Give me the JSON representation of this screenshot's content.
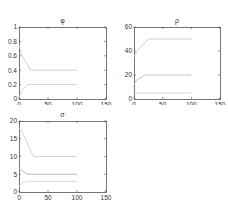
{
  "chart_data": [
    {
      "type": "line",
      "title": "φ",
      "xlabel": "",
      "ylabel": "",
      "xlim": [
        0,
        150
      ],
      "ylim": [
        0,
        1
      ],
      "xticks": [
        0,
        50,
        100,
        150
      ],
      "yticks": [
        0,
        0.2,
        0.4,
        0.6,
        0.8,
        1
      ],
      "ytick_labels": [
        "0",
        "0.2",
        "0.4",
        "0.6",
        "0.8",
        "1"
      ],
      "grid": false,
      "series": [
        {
          "name": "upper",
          "x": [
            0,
            5,
            20,
            100
          ],
          "y": [
            0.75,
            0.6,
            0.4,
            0.4
          ],
          "color": "#c8c8c8"
        },
        {
          "name": "lower",
          "x": [
            0,
            5,
            15,
            100
          ],
          "y": [
            0.02,
            0.12,
            0.2,
            0.2
          ],
          "color": "#d0d0d0"
        }
      ]
    },
    {
      "type": "line",
      "title": "ρ",
      "xlabel": "",
      "ylabel": "",
      "xlim": [
        0,
        150
      ],
      "ylim": [
        0,
        60
      ],
      "xticks": [
        0,
        50,
        100,
        150
      ],
      "yticks": [
        0,
        20,
        40,
        60
      ],
      "ytick_labels": [
        "0",
        "20",
        "40",
        "60"
      ],
      "grid": false,
      "series": [
        {
          "name": "high",
          "x": [
            0,
            5,
            25,
            100
          ],
          "y": [
            35,
            40,
            50,
            50
          ],
          "color": "#c8c8c8"
        },
        {
          "name": "mid",
          "x": [
            0,
            5,
            20,
            100
          ],
          "y": [
            12,
            16,
            20,
            20
          ],
          "color": "#c0c0c0"
        },
        {
          "name": "low",
          "x": [
            0,
            100
          ],
          "y": [
            5,
            5
          ],
          "color": "#d0d0d0"
        }
      ]
    },
    {
      "type": "line",
      "title": "σ",
      "xlabel": "",
      "ylabel": "",
      "xlim": [
        0,
        150
      ],
      "ylim": [
        0,
        20
      ],
      "xticks": [
        0,
        50,
        100,
        150
      ],
      "yticks": [
        0,
        5,
        10,
        15,
        20
      ],
      "ytick_labels": [
        "0",
        "5",
        "10",
        "15",
        "20"
      ],
      "grid": false,
      "series": [
        {
          "name": "high",
          "x": [
            0,
            5,
            25,
            100
          ],
          "y": [
            18,
            17,
            10,
            10
          ],
          "color": "#d0d0d0"
        },
        {
          "name": "mid",
          "x": [
            0,
            5,
            15,
            100
          ],
          "y": [
            6.5,
            6,
            5,
            5
          ],
          "color": "#b8b8b8"
        },
        {
          "name": "low",
          "x": [
            0,
            5,
            15,
            100
          ],
          "y": [
            1.5,
            2.5,
            3,
            3
          ],
          "color": "#d8d8d8"
        }
      ]
    }
  ],
  "panels": [
    {
      "title": "φ"
    },
    {
      "title": "ρ"
    },
    {
      "title": "σ"
    }
  ],
  "colors": {
    "axis": "#555555",
    "tick_label": "#333333",
    "background": "#ffffff"
  }
}
